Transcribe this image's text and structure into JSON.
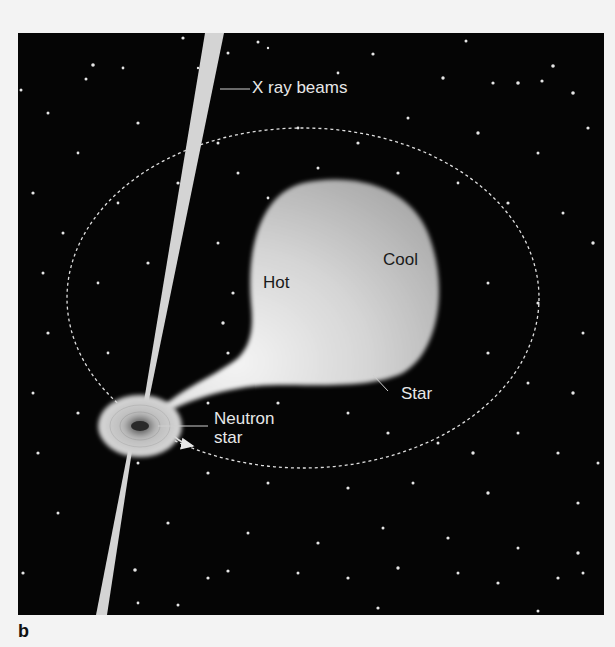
{
  "figure": {
    "panel_label": "b",
    "labels": {
      "xray_beams": "X ray beams",
      "hot": "Hot",
      "cool": "Cool",
      "star": "Star",
      "neutron_star_line1": "Neutron",
      "neutron_star_line2": "star"
    },
    "colors": {
      "background": "#050505",
      "page": "#f3f3f3",
      "star_body": "#c8c8c8",
      "star_hot": "#f0f0f0",
      "beam": "#d4d4d4",
      "orbit": "#e0e0e0"
    }
  }
}
